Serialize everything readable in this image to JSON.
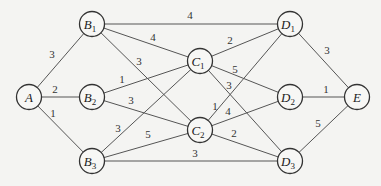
{
  "diagram": {
    "type": "weighted-undirected-graph",
    "nodes": [
      {
        "id": "A",
        "letter": "A",
        "sub": "",
        "x": 29,
        "y": 97
      },
      {
        "id": "B1",
        "letter": "B",
        "sub": "1",
        "x": 92,
        "y": 24
      },
      {
        "id": "B2",
        "letter": "B",
        "sub": "2",
        "x": 92,
        "y": 97
      },
      {
        "id": "B3",
        "letter": "B",
        "sub": "3",
        "x": 92,
        "y": 161
      },
      {
        "id": "C1",
        "letter": "C",
        "sub": "1",
        "x": 200,
        "y": 61
      },
      {
        "id": "C2",
        "letter": "C",
        "sub": "2",
        "x": 200,
        "y": 130
      },
      {
        "id": "D1",
        "letter": "D",
        "sub": "1",
        "x": 290,
        "y": 24
      },
      {
        "id": "D2",
        "letter": "D",
        "sub": "2",
        "x": 290,
        "y": 97
      },
      {
        "id": "D3",
        "letter": "D",
        "sub": "3",
        "x": 290,
        "y": 161
      },
      {
        "id": "E",
        "letter": "E",
        "sub": "",
        "x": 357,
        "y": 97
      }
    ],
    "edges": [
      {
        "from": "A",
        "to": "B1",
        "weight": "3",
        "lx": 52,
        "ly": 58
      },
      {
        "from": "A",
        "to": "B2",
        "weight": "2",
        "lx": 55,
        "ly": 93
      },
      {
        "from": "A",
        "to": "B3",
        "weight": "1",
        "lx": 53,
        "ly": 117
      },
      {
        "from": "B1",
        "to": "D1",
        "weight": "4",
        "lx": 190,
        "ly": 19
      },
      {
        "from": "B1",
        "to": "C1",
        "weight": "4",
        "lx": 153,
        "ly": 41
      },
      {
        "from": "B1",
        "to": "C2",
        "weight": "3",
        "lx": 139,
        "ly": 65
      },
      {
        "from": "B2",
        "to": "C1",
        "weight": "1",
        "lx": 122,
        "ly": 83
      },
      {
        "from": "B2",
        "to": "C2",
        "weight": "3",
        "lx": 131,
        "ly": 104
      },
      {
        "from": "B3",
        "to": "C1",
        "weight": "3",
        "lx": 118,
        "ly": 132
      },
      {
        "from": "B3",
        "to": "C2",
        "weight": "5",
        "lx": 148,
        "ly": 138
      },
      {
        "from": "B3",
        "to": "D3",
        "weight": "3",
        "lx": 195,
        "ly": 157
      },
      {
        "from": "C1",
        "to": "D1",
        "weight": "2",
        "lx": 230,
        "ly": 44
      },
      {
        "from": "C1",
        "to": "D2",
        "weight": "5",
        "lx": 235,
        "ly": 73
      },
      {
        "from": "C1",
        "to": "D3",
        "weight": "3",
        "lx": 229,
        "ly": 89
      },
      {
        "from": "C2",
        "to": "D1",
        "weight": "1",
        "lx": 215,
        "ly": 110
      },
      {
        "from": "C2",
        "to": "D2",
        "weight": "4",
        "lx": 228,
        "ly": 115
      },
      {
        "from": "C2",
        "to": "D3",
        "weight": "2",
        "lx": 234,
        "ly": 137
      },
      {
        "from": "D1",
        "to": "E",
        "weight": "3",
        "lx": 327,
        "ly": 54
      },
      {
        "from": "D2",
        "to": "E",
        "weight": "1",
        "lx": 326,
        "ly": 93
      },
      {
        "from": "D3",
        "to": "E",
        "weight": "5",
        "lx": 318,
        "ly": 127
      }
    ]
  }
}
